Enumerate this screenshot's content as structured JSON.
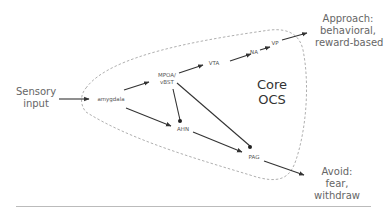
{
  "diagram": {
    "inputs": {
      "sensory": [
        "Sensory",
        "input"
      ]
    },
    "nodes": {
      "amygdala": "amygdala",
      "mpoa_vbst": [
        "MPOA/",
        "vBST"
      ],
      "vta": "VTA",
      "na": "NA",
      "vp": "VP",
      "ahn": "AHN",
      "pag": "PAG"
    },
    "core_label": [
      "Core",
      "OCS"
    ],
    "outputs": {
      "approach": [
        "Approach:",
        "behavioral,",
        "reward-based"
      ],
      "avoid": [
        "Avoid:",
        "fear,",
        "withdraw"
      ]
    },
    "edges": [
      {
        "from": "Sensory input",
        "to": "amygdala",
        "type": "arrow"
      },
      {
        "from": "amygdala",
        "to": "MPOA/vBST",
        "type": "arrow"
      },
      {
        "from": "amygdala",
        "to": "AHN",
        "type": "arrow"
      },
      {
        "from": "MPOA/vBST",
        "to": "VTA",
        "type": "arrow"
      },
      {
        "from": "VTA",
        "to": "NA",
        "type": "arrow"
      },
      {
        "from": "NA",
        "to": "VP",
        "type": "arrow"
      },
      {
        "from": "VP",
        "to": "Approach",
        "type": "arrow"
      },
      {
        "from": "MPOA/vBST",
        "to": "AHN",
        "type": "dot"
      },
      {
        "from": "MPOA/vBST",
        "to": "PAG",
        "type": "dot"
      },
      {
        "from": "AHN",
        "to": "PAG",
        "type": "arrow"
      },
      {
        "from": "PAG",
        "to": "Avoid",
        "type": "arrow"
      }
    ],
    "colors": {
      "line": "#333333",
      "dashed": "#999999",
      "text": "#666666",
      "divider": "#bbbbbb"
    }
  }
}
